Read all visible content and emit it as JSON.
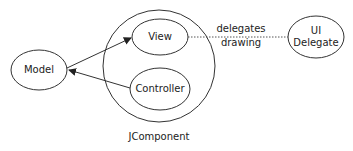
{
  "diagram": {
    "nodes": {
      "model": {
        "label": "Model"
      },
      "view": {
        "label": "View"
      },
      "controller": {
        "label": "Controller"
      },
      "ui_delegate": {
        "line1": "UI",
        "line2": "Delegate"
      },
      "jcomponent": {
        "label": "JComponent"
      }
    },
    "edges": {
      "delegates": {
        "line1": "delegates",
        "line2": "drawing"
      }
    },
    "colors": {
      "stroke": "#333333",
      "text": "#222222",
      "background": "#ffffff"
    }
  }
}
